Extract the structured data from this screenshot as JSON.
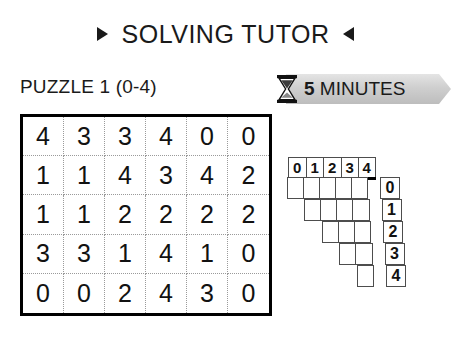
{
  "header": {
    "title": "SOLVING TUTOR",
    "left_marker": "triangle-right",
    "right_marker": "triangle-left"
  },
  "subheader": {
    "puzzle_label": "PUZZLE 1 (0-4)",
    "timer": {
      "icon": "hourglass-icon",
      "value": "5",
      "unit": "MINUTES"
    }
  },
  "puzzle_grid": {
    "columns": 6,
    "rows": 5,
    "values": [
      [
        "4",
        "3",
        "3",
        "4",
        "0",
        "0"
      ],
      [
        "1",
        "1",
        "4",
        "3",
        "4",
        "2"
      ],
      [
        "1",
        "1",
        "2",
        "2",
        "2",
        "2"
      ],
      [
        "3",
        "3",
        "1",
        "4",
        "1",
        "0"
      ],
      [
        "0",
        "0",
        "2",
        "4",
        "3",
        "0"
      ]
    ]
  },
  "tally_table": {
    "column_headers": [
      "0",
      "1",
      "2",
      "3",
      "4"
    ],
    "row_labels": [
      "0",
      "1",
      "2",
      "3",
      "4"
    ],
    "row_cell_counts": [
      5,
      4,
      3,
      2,
      1
    ]
  },
  "colors": {
    "ink": "#1a1a1a",
    "grid_border": "#000000",
    "grid_inner": "#9a9a9a",
    "tally_line": "#4d4d4d",
    "ribbon_light": "#e4e4e4",
    "ribbon_dark": "#bdbdbd"
  }
}
